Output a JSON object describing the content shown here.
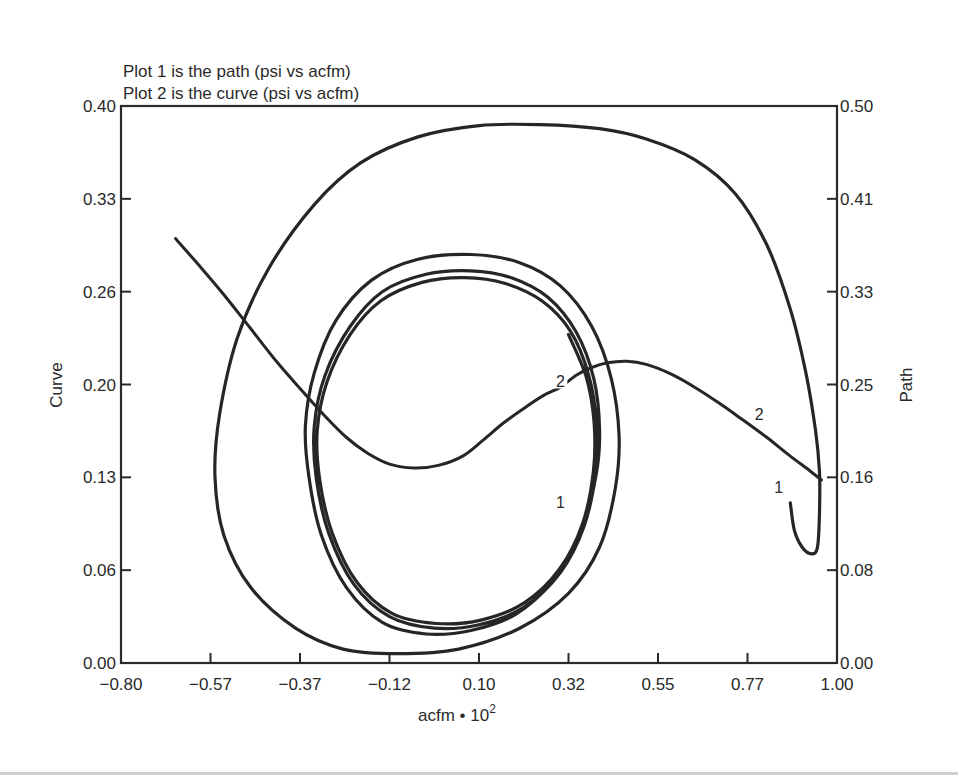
{
  "chart_data": {
    "type": "line",
    "title_lines": [
      "Plot 1 is the path (psi vs acfm)",
      "Plot 2 is the curve (psi vs acfm)"
    ],
    "xlabel": "acfm • 10",
    "xlabel_superscript": "2",
    "ylabel_left": "Curve",
    "ylabel_right": "Path",
    "xlim": [
      -0.8,
      1.0
    ],
    "ylim_left": [
      0.0,
      0.4
    ],
    "ylim_right": [
      0.0,
      0.5
    ],
    "x_ticks": [
      "-0.80",
      "-0.57",
      "-0.37",
      "-0.12",
      "0.10",
      "0.32",
      "0.55",
      "0.77",
      "1.00"
    ],
    "x_tick_values": [
      -0.8,
      -0.57,
      -0.37,
      -0.12,
      0.1,
      0.32,
      0.55,
      0.77,
      1.0
    ],
    "y_ticks_left": [
      "0.40",
      "0.33",
      "0.26",
      "0.20",
      "0.13",
      "0.06",
      "0.00"
    ],
    "y_tick_values_left": [
      0.4,
      0.33,
      0.26,
      0.2,
      0.13,
      0.06,
      0.0
    ],
    "y_ticks_right": [
      "0.50",
      "0.41",
      "0.33",
      "0.25",
      "0.16",
      "0.08",
      "0.00"
    ],
    "y_tick_values_right": [
      0.5,
      0.41,
      0.33,
      0.25,
      0.16,
      0.08,
      0.0
    ],
    "grid": false,
    "legend": "none (series identified by inline numeric labels 1 and 2)",
    "series": [
      {
        "name": "1 (Path, psi vs acfm)",
        "axis": "right",
        "marker_label": "1",
        "description": "Spiral starting near (0.88, 0.12), hooking down to (0.95, 0.09), sweeping up to (0.10, 0.47) and spiraling inward to a limit cycle centered near (0.0, 0.18)",
        "points": [
          [
            0.88,
            0.138
          ],
          [
            0.89,
            0.115
          ],
          [
            0.91,
            0.1
          ],
          [
            0.935,
            0.094
          ],
          [
            0.95,
            0.1
          ],
          [
            0.955,
            0.13
          ],
          [
            0.955,
            0.165
          ],
          [
            0.945,
            0.205
          ],
          [
            0.92,
            0.26
          ],
          [
            0.88,
            0.315
          ],
          [
            0.82,
            0.37
          ],
          [
            0.74,
            0.415
          ],
          [
            0.64,
            0.448
          ],
          [
            0.52,
            0.468
          ],
          [
            0.4,
            0.478
          ],
          [
            0.25,
            0.482
          ],
          [
            0.1,
            0.481
          ],
          [
            -0.05,
            0.47
          ],
          [
            -0.2,
            0.445
          ],
          [
            -0.33,
            0.405
          ],
          [
            -0.44,
            0.35
          ],
          [
            -0.51,
            0.29
          ],
          [
            -0.55,
            0.22
          ],
          [
            -0.56,
            0.16
          ],
          [
            -0.54,
            0.11
          ],
          [
            -0.48,
            0.065
          ],
          [
            -0.38,
            0.03
          ],
          [
            -0.25,
            0.012
          ],
          [
            -0.1,
            0.008
          ],
          [
            0.05,
            0.012
          ],
          [
            0.2,
            0.03
          ],
          [
            0.32,
            0.06
          ],
          [
            0.4,
            0.1
          ],
          [
            0.44,
            0.15
          ],
          [
            0.45,
            0.2
          ],
          [
            0.43,
            0.255
          ],
          [
            0.38,
            0.3
          ],
          [
            0.3,
            0.335
          ],
          [
            0.2,
            0.355
          ],
          [
            0.08,
            0.362
          ],
          [
            -0.05,
            0.358
          ],
          [
            -0.17,
            0.34
          ],
          [
            -0.27,
            0.305
          ],
          [
            -0.33,
            0.26
          ],
          [
            -0.355,
            0.21
          ],
          [
            -0.345,
            0.16
          ],
          [
            -0.31,
            0.11
          ],
          [
            -0.24,
            0.065
          ],
          [
            -0.14,
            0.035
          ],
          [
            -0.03,
            0.025
          ],
          [
            0.08,
            0.028
          ],
          [
            0.19,
            0.042
          ],
          [
            0.28,
            0.07
          ],
          [
            0.35,
            0.11
          ],
          [
            0.39,
            0.16
          ],
          [
            0.4,
            0.205
          ],
          [
            0.385,
            0.255
          ],
          [
            0.34,
            0.295
          ],
          [
            0.27,
            0.325
          ],
          [
            0.18,
            0.342
          ],
          [
            0.08,
            0.348
          ],
          [
            -0.03,
            0.345
          ],
          [
            -0.14,
            0.33
          ],
          [
            -0.23,
            0.3
          ],
          [
            -0.3,
            0.258
          ],
          [
            -0.33,
            0.21
          ],
          [
            -0.325,
            0.16
          ],
          [
            -0.29,
            0.112
          ],
          [
            -0.22,
            0.068
          ],
          [
            -0.12,
            0.04
          ],
          [
            -0.01,
            0.03
          ],
          [
            0.1,
            0.033
          ],
          [
            0.21,
            0.048
          ],
          [
            0.3,
            0.078
          ],
          [
            0.36,
            0.118
          ],
          [
            0.39,
            0.165
          ],
          [
            0.392,
            0.212
          ],
          [
            0.372,
            0.258
          ],
          [
            0.325,
            0.296
          ],
          [
            0.255,
            0.322
          ],
          [
            0.165,
            0.337
          ],
          [
            0.065,
            0.342
          ],
          [
            -0.04,
            0.338
          ],
          [
            -0.145,
            0.322
          ],
          [
            -0.23,
            0.293
          ],
          [
            -0.295,
            0.252
          ],
          [
            -0.322,
            0.205
          ],
          [
            -0.315,
            0.158
          ],
          [
            -0.28,
            0.112
          ],
          [
            -0.212,
            0.07
          ],
          [
            -0.115,
            0.043
          ],
          [
            -0.005,
            0.034
          ],
          [
            0.105,
            0.037
          ],
          [
            0.212,
            0.052
          ],
          [
            0.298,
            0.081
          ],
          [
            0.356,
            0.12
          ],
          [
            0.384,
            0.166
          ],
          [
            0.386,
            0.212
          ],
          [
            0.366,
            0.256
          ],
          [
            0.32,
            0.293
          ]
        ]
      },
      {
        "name": "2 (Curve, psi vs acfm)",
        "axis": "left",
        "marker_label": "2",
        "description": "Descends from (-0.66, 0.30) to a minimum near (-0.05, 0.137), rises to a maximum near (0.47, 0.215), then descends to (0.96, 0.13)",
        "points": [
          [
            -0.66,
            0.3
          ],
          [
            -0.6,
            0.28
          ],
          [
            -0.54,
            0.258
          ],
          [
            -0.48,
            0.236
          ],
          [
            -0.42,
            0.214
          ],
          [
            -0.36,
            0.194
          ],
          [
            -0.3,
            0.176
          ],
          [
            -0.24,
            0.16
          ],
          [
            -0.18,
            0.148
          ],
          [
            -0.12,
            0.14
          ],
          [
            -0.06,
            0.137
          ],
          [
            0.0,
            0.139
          ],
          [
            0.06,
            0.146
          ],
          [
            0.11,
            0.158
          ],
          [
            0.16,
            0.171
          ],
          [
            0.21,
            0.182
          ],
          [
            0.26,
            0.192
          ],
          [
            0.3,
            0.198
          ],
          [
            0.34,
            0.206
          ],
          [
            0.38,
            0.211
          ],
          [
            0.42,
            0.214
          ],
          [
            0.47,
            0.215
          ],
          [
            0.52,
            0.213
          ],
          [
            0.58,
            0.207
          ],
          [
            0.64,
            0.198
          ],
          [
            0.7,
            0.186
          ],
          [
            0.76,
            0.173
          ],
          [
            0.82,
            0.16
          ],
          [
            0.88,
            0.146
          ],
          [
            0.93,
            0.135
          ],
          [
            0.96,
            0.128
          ]
        ]
      }
    ],
    "annotations": [
      {
        "text": "2",
        "x": 0.3,
        "y": 0.2,
        "axis": "left"
      },
      {
        "text": "2",
        "x": 0.8,
        "y": 0.175,
        "axis": "left"
      },
      {
        "text": "1",
        "x": 0.85,
        "y": 0.148,
        "axis": "right"
      },
      {
        "text": "1",
        "x": 0.3,
        "y": 0.135,
        "axis": "right"
      }
    ]
  }
}
